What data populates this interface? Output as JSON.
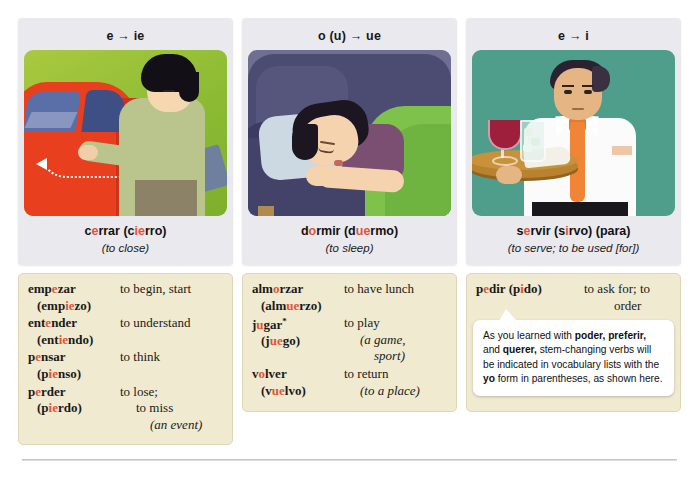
{
  "columns": [
    {
      "header": "e → ie",
      "illustration_name": "closing-car-door-illustration",
      "caption_parts": [
        {
          "t": "c",
          "hl": false
        },
        {
          "t": "e",
          "hl": true
        },
        {
          "t": "rrar (c",
          "hl": false
        },
        {
          "t": "ie",
          "hl": true
        },
        {
          "t": "rro)",
          "hl": false
        }
      ],
      "caption_es": "cerrar (cierro)",
      "caption_en": "(to close)",
      "entries": [
        {
          "inf_parts": [
            {
              "t": "emp",
              "hl": false
            },
            {
              "t": "e",
              "hl": true
            },
            {
              "t": "zar",
              "hl": false
            }
          ],
          "yo_parts": [
            {
              "t": "(emp",
              "hl": false
            },
            {
              "t": "ie",
              "hl": true
            },
            {
              "t": "zo)",
              "hl": false
            }
          ],
          "meaning": "to begin, start",
          "meaning_lines": []
        },
        {
          "inf_parts": [
            {
              "t": "ent",
              "hl": false
            },
            {
              "t": "e",
              "hl": true
            },
            {
              "t": "nder",
              "hl": false
            }
          ],
          "yo_parts": [
            {
              "t": "(ent",
              "hl": false
            },
            {
              "t": "ie",
              "hl": true
            },
            {
              "t": "ndo)",
              "hl": false
            }
          ],
          "meaning": "to understand",
          "meaning_lines": []
        },
        {
          "inf_parts": [
            {
              "t": "p",
              "hl": false
            },
            {
              "t": "e",
              "hl": true
            },
            {
              "t": "nsar",
              "hl": false
            }
          ],
          "yo_parts": [
            {
              "t": "(p",
              "hl": false
            },
            {
              "t": "ie",
              "hl": true
            },
            {
              "t": "nso)",
              "hl": false
            }
          ],
          "meaning": "to think",
          "meaning_lines": []
        },
        {
          "inf_parts": [
            {
              "t": "p",
              "hl": false
            },
            {
              "t": "e",
              "hl": true
            },
            {
              "t": "rder",
              "hl": false
            }
          ],
          "yo_parts": [
            {
              "t": "(p",
              "hl": false
            },
            {
              "t": "ie",
              "hl": true
            },
            {
              "t": "rdo)",
              "hl": false
            }
          ],
          "meaning": "to lose;",
          "meaning_lines": [
            {
              "text": "to miss",
              "indent": 1,
              "italic": false
            },
            {
              "text": "(an event)",
              "indent": 2,
              "italic": true
            }
          ]
        }
      ]
    },
    {
      "header": "o (u) → ue",
      "illustration_name": "sleeping-on-couch-illustration",
      "caption_parts": [
        {
          "t": "d",
          "hl": false
        },
        {
          "t": "o",
          "hl": true
        },
        {
          "t": "rmir (d",
          "hl": false
        },
        {
          "t": "ue",
          "hl": true
        },
        {
          "t": "rmo)",
          "hl": false
        }
      ],
      "caption_es": "dormir (duermo)",
      "caption_en": "(to sleep)",
      "entries": [
        {
          "inf_parts": [
            {
              "t": "alm",
              "hl": false
            },
            {
              "t": "o",
              "hl": true
            },
            {
              "t": "rzar",
              "hl": false
            }
          ],
          "yo_parts": [
            {
              "t": "(alm",
              "hl": false
            },
            {
              "t": "ue",
              "hl": true
            },
            {
              "t": "rzo)",
              "hl": false
            }
          ],
          "meaning": "to have lunch",
          "meaning_lines": []
        },
        {
          "inf_parts": [
            {
              "t": "j",
              "hl": false
            },
            {
              "t": "u",
              "hl": true
            },
            {
              "t": "gar",
              "hl": false
            },
            {
              "t": "*",
              "hl": false,
              "sup": true
            }
          ],
          "yo_parts": [
            {
              "t": "(j",
              "hl": false
            },
            {
              "t": "ue",
              "hl": true
            },
            {
              "t": "go)",
              "hl": false
            }
          ],
          "meaning": "to play",
          "meaning_lines": [
            {
              "text": "(a game,",
              "indent": 1,
              "italic": true
            },
            {
              "text": "sport)",
              "indent": 2,
              "italic": true
            }
          ]
        },
        {
          "inf_parts": [
            {
              "t": "v",
              "hl": false
            },
            {
              "t": "o",
              "hl": true
            },
            {
              "t": "lver",
              "hl": false
            }
          ],
          "yo_parts": [
            {
              "t": "(v",
              "hl": false
            },
            {
              "t": "ue",
              "hl": true
            },
            {
              "t": "lvo)",
              "hl": false
            }
          ],
          "meaning": "to return",
          "meaning_lines": [
            {
              "text": "(to a place)",
              "indent": 1,
              "italic": true
            }
          ]
        }
      ]
    },
    {
      "header": "e → i",
      "illustration_name": "waiter-with-tray-illustration",
      "caption_parts": [
        {
          "t": "s",
          "hl": false
        },
        {
          "t": "e",
          "hl": true
        },
        {
          "t": "rvir (s",
          "hl": false
        },
        {
          "t": "i",
          "hl": true
        },
        {
          "t": "rvo) (para)",
          "hl": false
        }
      ],
      "caption_es": "servir (sirvo) (para)",
      "caption_en": "(to serve; to be used [for])",
      "entries": [
        {
          "inline": true,
          "inf_parts": [
            {
              "t": "p",
              "hl": false
            },
            {
              "t": "e",
              "hl": true
            },
            {
              "t": "dir (p",
              "hl": false
            },
            {
              "t": "i",
              "hl": true
            },
            {
              "t": "do)",
              "hl": false
            }
          ],
          "yo_parts": [],
          "meaning": "to ask for; to",
          "meaning_lines": [
            {
              "text": "order",
              "indent": 2,
              "italic": false
            }
          ]
        }
      ],
      "callout": {
        "segments": [
          {
            "t": "As you learned with ",
            "b": false
          },
          {
            "t": "poder, preferir,",
            "b": true
          },
          {
            "t": " and ",
            "b": false
          },
          {
            "t": "querer,",
            "b": true
          },
          {
            "t": " stem-changing verbs will be indicated in vocabulary lists with the ",
            "b": false
          },
          {
            "t": "yo",
            "b": true
          },
          {
            "t": " form in parentheses, as shown here.",
            "b": false
          }
        ],
        "full_text": "As you learned with poder, preferir, and querer, stem-changing verbs will be indicated in vocabulary lists with the yo form in parentheses, as shown here."
      }
    }
  ],
  "colors": {
    "highlight": "#e2533a",
    "card_bg": "#e9e9ee",
    "vocab_bg": "#efead0",
    "vocab_border": "#ded7b6",
    "callout_bg": "#ffffff",
    "scene1_bg": "#8cbb33",
    "scene2_bg": "#6f6f93",
    "scene3_bg": "#4f9e8c"
  }
}
